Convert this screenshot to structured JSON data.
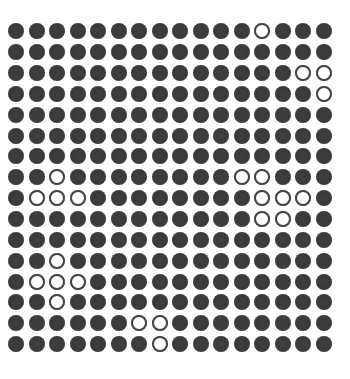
{
  "grid": {
    "rows": 16,
    "cols": 16,
    "colors": {
      "filled": "#3a3a3a",
      "open_fill": "#ffffff",
      "open_stroke": "#454545",
      "background": "#ffffff"
    },
    "open_cells": [
      [
        0,
        12
      ],
      [
        2,
        14
      ],
      [
        2,
        15
      ],
      [
        3,
        15
      ],
      [
        7,
        2
      ],
      [
        7,
        11
      ],
      [
        7,
        12
      ],
      [
        8,
        1
      ],
      [
        8,
        2
      ],
      [
        8,
        3
      ],
      [
        8,
        12
      ],
      [
        8,
        13
      ],
      [
        8,
        14
      ],
      [
        9,
        12
      ],
      [
        9,
        13
      ],
      [
        11,
        2
      ],
      [
        12,
        1
      ],
      [
        12,
        2
      ],
      [
        12,
        3
      ],
      [
        13,
        2
      ],
      [
        14,
        6
      ],
      [
        14,
        7
      ],
      [
        15,
        7
      ]
    ],
    "matrix": [
      "1111111111110111",
      "1111111111111111",
      "1111111111111100",
      "1111111111111110",
      "1111111111111111",
      "1111111111111111",
      "1111111111111111",
      "1101111111100111",
      "1000111111110001",
      "1111111111110011",
      "1111111111111111",
      "1101111111111111",
      "1000111111111111",
      "1101111111111111",
      "1111110011111111",
      "1111111011111111"
    ]
  }
}
